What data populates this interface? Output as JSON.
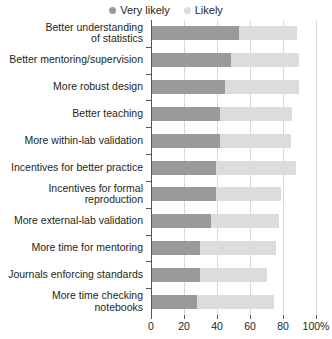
{
  "chart_data": {
    "type": "bar",
    "orientation": "horizontal",
    "stacked": true,
    "title": "",
    "subtitle": "",
    "xlabel": "",
    "ylabel": "",
    "xlim": [
      0,
      100
    ],
    "xticks": [
      0,
      20,
      40,
      60,
      80,
      100
    ],
    "xticklabels": [
      "0",
      "20",
      "40",
      "60",
      "80",
      "100%"
    ],
    "grid": "vertical",
    "legend_position": "top-center",
    "categories": [
      "Better understanding of statistics",
      "Better mentoring/supervision",
      "More robust design",
      "Better teaching",
      "More within-lab validation",
      "Incentives for better practice",
      "Incentives for formal reproduction",
      "More external-lab validation",
      "More time for mentoring",
      "Journals enforcing standards",
      "More time checking notebooks"
    ],
    "series": [
      {
        "name": "Very likely",
        "color": "#9a9a9a",
        "values": [
          53,
          48,
          44,
          41,
          41,
          39,
          39,
          36,
          29,
          29,
          27
        ]
      },
      {
        "name": "Likely",
        "color": "#dcdcdc",
        "values": [
          35,
          41,
          45,
          44,
          43,
          48,
          39,
          41,
          46,
          41,
          47
        ]
      }
    ],
    "totals": [
      88,
      89,
      89,
      85,
      84,
      87,
      78,
      77,
      75,
      70,
      74
    ]
  },
  "legend": {
    "items": [
      {
        "label": "Very likely",
        "color": "#9a9a9a"
      },
      {
        "label": "Likely",
        "color": "#dcdcdc"
      }
    ]
  },
  "axis": {
    "x": {
      "ticklabels": [
        "0",
        "20",
        "40",
        "60",
        "80",
        "100%"
      ]
    },
    "y": {
      "labels": [
        {
          "lines": [
            "Better understanding",
            "of statistics"
          ]
        },
        {
          "lines": [
            "Better mentoring/supervision"
          ]
        },
        {
          "lines": [
            "More robust design"
          ]
        },
        {
          "lines": [
            "Better teaching"
          ]
        },
        {
          "lines": [
            "More within-lab validation"
          ]
        },
        {
          "lines": [
            "Incentives for better practice"
          ]
        },
        {
          "lines": [
            "Incentives for formal",
            "reproduction"
          ]
        },
        {
          "lines": [
            "More external-lab validation"
          ]
        },
        {
          "lines": [
            "More time for mentoring"
          ]
        },
        {
          "lines": [
            "Journals enforcing standards"
          ]
        },
        {
          "lines": [
            "More time checking",
            "notebooks"
          ]
        }
      ]
    }
  },
  "colors": {
    "very_likely": "#9a9a9a",
    "likely": "#dcdcdc",
    "grid": "#d8d8d8",
    "axis": "#555555",
    "text": "#231f20",
    "background": "#ffffff"
  }
}
